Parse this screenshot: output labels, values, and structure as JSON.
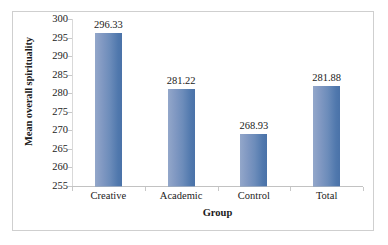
{
  "chart_data": {
    "type": "bar",
    "title": "",
    "xlabel": "Group",
    "ylabel": "Mean overall spirituality",
    "categories": [
      "Creative",
      "Academic",
      "Control",
      "Total"
    ],
    "values": [
      296.33,
      281.22,
      268.93,
      281.88
    ],
    "data_labels": [
      "296.33",
      "281.22",
      "268.93",
      "281.88"
    ],
    "ylim": [
      255,
      300
    ],
    "ytick_labels": [
      "300",
      "295",
      "290",
      "285",
      "280",
      "275",
      "270",
      "265",
      "260",
      "255"
    ],
    "ytick_values": [
      300,
      295,
      290,
      285,
      280,
      275,
      270,
      265,
      260,
      255
    ],
    "grid": false,
    "legend": false,
    "legend_position": "none",
    "series": [
      {
        "name": "Mean overall spirituality",
        "values": [
          296.33,
          281.22,
          268.93,
          281.88
        ]
      }
    ],
    "colors": {
      "bar_gradient_start": "#93a7ca",
      "bar_gradient_end": "#4a72a8",
      "axis_line": "#c8c8c8",
      "frame_border": "#cfcfcf",
      "text": "#1a1a1a",
      "background": "#ffffff"
    }
  }
}
